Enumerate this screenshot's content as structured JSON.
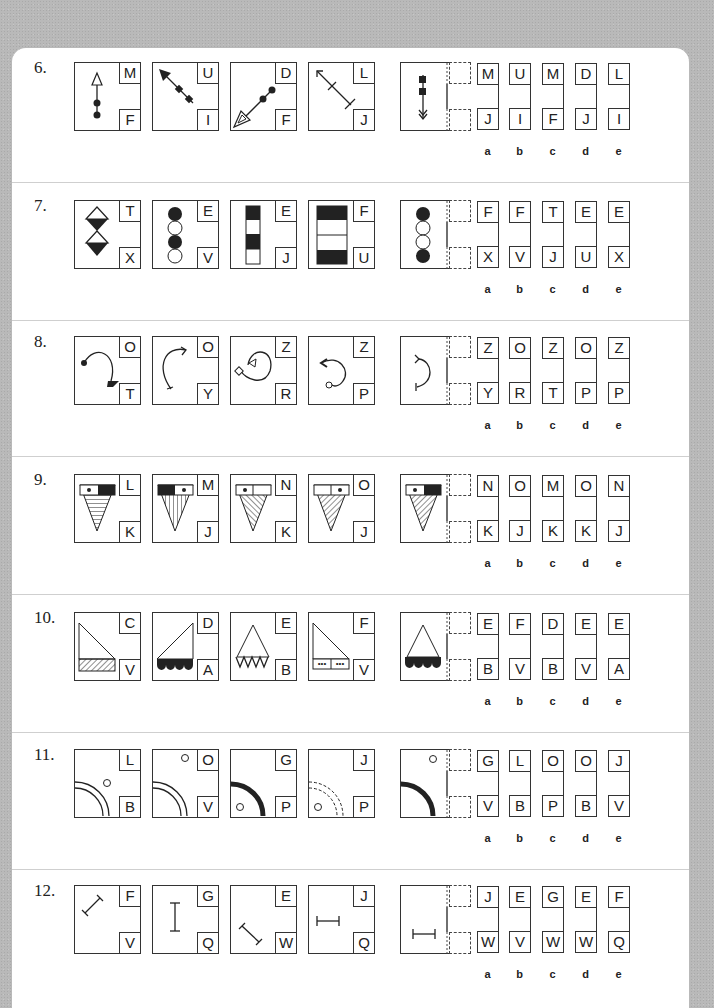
{
  "questions": [
    {
      "number": "6.",
      "series": [
        [
          "M",
          "F"
        ],
        [
          "U",
          "I"
        ],
        [
          "D",
          "F"
        ],
        [
          "L",
          "J"
        ]
      ],
      "options": [
        {
          "label": "a",
          "top": "M",
          "bottom": "J"
        },
        {
          "label": "b",
          "top": "U",
          "bottom": "I"
        },
        {
          "label": "c",
          "top": "M",
          "bottom": "F"
        },
        {
          "label": "d",
          "top": "D",
          "bottom": "J"
        },
        {
          "label": "e",
          "top": "L",
          "bottom": "I"
        }
      ]
    },
    {
      "number": "7.",
      "series": [
        [
          "T",
          "X"
        ],
        [
          "E",
          "V"
        ],
        [
          "E",
          "J"
        ],
        [
          "F",
          "U"
        ]
      ],
      "options": [
        {
          "label": "a",
          "top": "F",
          "bottom": "X"
        },
        {
          "label": "b",
          "top": "F",
          "bottom": "V"
        },
        {
          "label": "c",
          "top": "T",
          "bottom": "J"
        },
        {
          "label": "d",
          "top": "E",
          "bottom": "U"
        },
        {
          "label": "e",
          "top": "E",
          "bottom": "X"
        }
      ]
    },
    {
      "number": "8.",
      "series": [
        [
          "O",
          "T"
        ],
        [
          "O",
          "Y"
        ],
        [
          "Z",
          "R"
        ],
        [
          "Z",
          "P"
        ]
      ],
      "options": [
        {
          "label": "a",
          "top": "Z",
          "bottom": "Y"
        },
        {
          "label": "b",
          "top": "O",
          "bottom": "R"
        },
        {
          "label": "c",
          "top": "Z",
          "bottom": "T"
        },
        {
          "label": "d",
          "top": "O",
          "bottom": "P"
        },
        {
          "label": "e",
          "top": "Z",
          "bottom": "P"
        }
      ]
    },
    {
      "number": "9.",
      "series": [
        [
          "L",
          "K"
        ],
        [
          "M",
          "J"
        ],
        [
          "N",
          "K"
        ],
        [
          "O",
          "J"
        ]
      ],
      "options": [
        {
          "label": "a",
          "top": "N",
          "bottom": "K"
        },
        {
          "label": "b",
          "top": "O",
          "bottom": "J"
        },
        {
          "label": "c",
          "top": "M",
          "bottom": "K"
        },
        {
          "label": "d",
          "top": "O",
          "bottom": "K"
        },
        {
          "label": "e",
          "top": "N",
          "bottom": "J"
        }
      ]
    },
    {
      "number": "10.",
      "series": [
        [
          "C",
          "V"
        ],
        [
          "D",
          "A"
        ],
        [
          "E",
          "B"
        ],
        [
          "F",
          "V"
        ]
      ],
      "options": [
        {
          "label": "a",
          "top": "E",
          "bottom": "B"
        },
        {
          "label": "b",
          "top": "F",
          "bottom": "V"
        },
        {
          "label": "c",
          "top": "D",
          "bottom": "B"
        },
        {
          "label": "d",
          "top": "E",
          "bottom": "V"
        },
        {
          "label": "e",
          "top": "E",
          "bottom": "A"
        }
      ]
    },
    {
      "number": "11.",
      "series": [
        [
          "L",
          "B"
        ],
        [
          "O",
          "V"
        ],
        [
          "G",
          "P"
        ],
        [
          "J",
          "P"
        ]
      ],
      "options": [
        {
          "label": "a",
          "top": "G",
          "bottom": "V"
        },
        {
          "label": "b",
          "top": "L",
          "bottom": "B"
        },
        {
          "label": "c",
          "top": "O",
          "bottom": "P"
        },
        {
          "label": "d",
          "top": "O",
          "bottom": "B"
        },
        {
          "label": "e",
          "top": "J",
          "bottom": "V"
        }
      ]
    },
    {
      "number": "12.",
      "series": [
        [
          "F",
          "V"
        ],
        [
          "G",
          "Q"
        ],
        [
          "E",
          "W"
        ],
        [
          "J",
          "Q"
        ]
      ],
      "options": [
        {
          "label": "a",
          "top": "J",
          "bottom": "W"
        },
        {
          "label": "b",
          "top": "E",
          "bottom": "V"
        },
        {
          "label": "c",
          "top": "G",
          "bottom": "W"
        },
        {
          "label": "d",
          "top": "E",
          "bottom": "W"
        },
        {
          "label": "e",
          "top": "F",
          "bottom": "Q"
        }
      ]
    }
  ]
}
